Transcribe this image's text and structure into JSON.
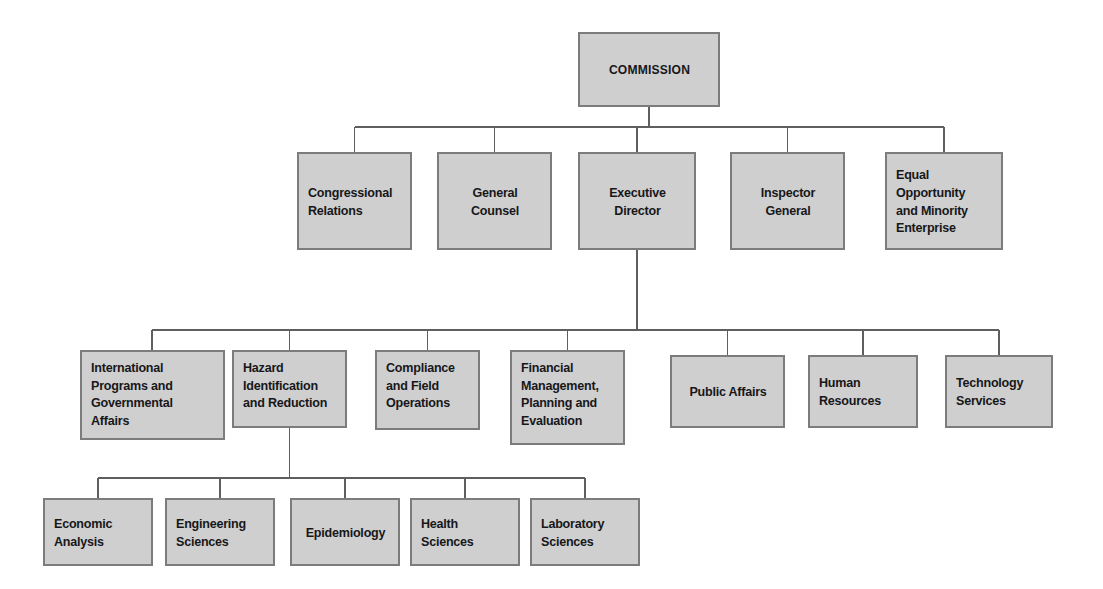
{
  "chart_meta": {
    "type": "organization-chart",
    "title": "Commission Organization Chart",
    "canvas": {
      "width": 1103,
      "height": 589
    },
    "colors": {
      "background": "#ffffff",
      "box_fill": "#cfcfcf",
      "box_border": "#7c7c7c",
      "connector": "#5f5f5f",
      "text": "#17171a"
    }
  },
  "nodes": {
    "commission": {
      "label": "COMMISSION",
      "level": 1
    },
    "congressional_relations": {
      "label": "Congressional\nRelations",
      "level": 2
    },
    "general_counsel": {
      "label": "General\nCounsel",
      "level": 2
    },
    "executive_director": {
      "label": "Executive\nDirector",
      "level": 2
    },
    "inspector_general": {
      "label": "Inspector\nGeneral",
      "level": 2
    },
    "equal_opportunity": {
      "label": "Equal\nOpportunity\nand Minority\nEnterprise",
      "level": 2
    },
    "international_programs": {
      "label": "International\nPrograms and\nGovernmental\nAffairs",
      "level": 3
    },
    "hazard_identification": {
      "label": "Hazard\nIdentification\nand Reduction",
      "level": 3
    },
    "compliance_field_operations": {
      "label": "Compliance\nand Field\nOperations",
      "level": 3
    },
    "financial_management": {
      "label": "Financial\nManagement,\nPlanning and\nEvaluation",
      "level": 3
    },
    "public_affairs": {
      "label": "Public Affairs",
      "level": 3
    },
    "human_resources": {
      "label": "Human\nResources",
      "level": 3
    },
    "technology_services": {
      "label": "Technology\nServices",
      "level": 3
    },
    "economic_analysis": {
      "label": "Economic\nAnalysis",
      "level": 4
    },
    "engineering_sciences": {
      "label": "Engineering\nSciences",
      "level": 4
    },
    "epidemiology": {
      "label": "Epidemiology",
      "level": 4
    },
    "health_sciences": {
      "label": "Health\nSciences",
      "level": 4
    },
    "laboratory_sciences": {
      "label": "Laboratory\nSciences",
      "level": 4
    }
  },
  "hierarchy": {
    "root": "commission",
    "edges": [
      {
        "from": "commission",
        "to": "congressional_relations"
      },
      {
        "from": "commission",
        "to": "general_counsel"
      },
      {
        "from": "commission",
        "to": "executive_director"
      },
      {
        "from": "commission",
        "to": "inspector_general"
      },
      {
        "from": "commission",
        "to": "equal_opportunity"
      },
      {
        "from": "executive_director",
        "to": "international_programs"
      },
      {
        "from": "executive_director",
        "to": "hazard_identification"
      },
      {
        "from": "executive_director",
        "to": "compliance_field_operations"
      },
      {
        "from": "executive_director",
        "to": "financial_management"
      },
      {
        "from": "executive_director",
        "to": "public_affairs"
      },
      {
        "from": "executive_director",
        "to": "human_resources"
      },
      {
        "from": "executive_director",
        "to": "technology_services"
      },
      {
        "from": "hazard_identification",
        "to": "economic_analysis"
      },
      {
        "from": "hazard_identification",
        "to": "engineering_sciences"
      },
      {
        "from": "hazard_identification",
        "to": "epidemiology"
      },
      {
        "from": "hazard_identification",
        "to": "health_sciences"
      },
      {
        "from": "hazard_identification",
        "to": "laboratory_sciences"
      }
    ]
  }
}
